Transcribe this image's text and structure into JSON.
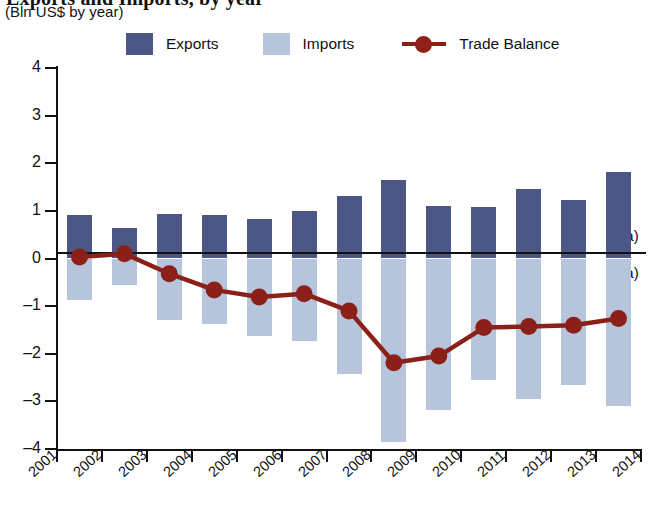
{
  "header": {
    "title_clipped": "Exports and Imports, by year",
    "subtitle": "(Bln US$ by year)"
  },
  "legend": {
    "items": [
      {
        "label": "Exports",
        "type": "swatch",
        "color": "#4d5786",
        "icon": "square-swatch-icon"
      },
      {
        "label": "Imports",
        "type": "swatch",
        "color": "#b6c5dc",
        "icon": "square-swatch-icon"
      },
      {
        "label": "Trade Balance",
        "type": "line-marker",
        "color": "#8b2018",
        "icon": "line-marker-icon"
      }
    ]
  },
  "annotations": {
    "na_above": "(na)",
    "na_below": "(na)"
  },
  "chart_data": {
    "type": "bar",
    "title": "Exports and Imports, by year",
    "subtitle": "(Bln US$ by year)",
    "xlabel": "",
    "ylabel": "",
    "ylim": [
      -4,
      4
    ],
    "ytick_labels": [
      "4",
      "3",
      "2",
      "1",
      "0",
      "–1",
      "–2",
      "–3",
      "–4"
    ],
    "ytick_values": [
      4,
      3,
      2,
      1,
      0,
      -1,
      -2,
      -3,
      -4
    ],
    "grid": false,
    "legend_position": "top",
    "xtick_labels": [
      "2001",
      "2002",
      "2003",
      "2004",
      "2005",
      "2006",
      "2007",
      "2008",
      "2009",
      "2010",
      "2011",
      "2012",
      "2013",
      "2014"
    ],
    "categories": [
      "2001",
      "2002",
      "2003",
      "2004",
      "2005",
      "2006",
      "2007",
      "2008",
      "2009",
      "2010",
      "2011",
      "2012",
      "2013"
    ],
    "series": [
      {
        "name": "Exports",
        "type": "bar",
        "color": "#4d5786",
        "values": [
          0.92,
          0.63,
          0.93,
          0.92,
          0.83,
          0.99,
          1.32,
          1.65,
          1.1,
          1.09,
          1.46,
          1.22,
          1.82
        ]
      },
      {
        "name": "Imports",
        "type": "bar",
        "color": "#b6c5dc",
        "values": [
          -0.88,
          -0.55,
          -1.3,
          -1.38,
          -1.63,
          -1.73,
          -2.42,
          -3.85,
          -3.18,
          -2.55,
          -2.95,
          -2.65,
          -3.1
        ]
      },
      {
        "name": "Trade Balance",
        "type": "line",
        "color": "#8b2018",
        "values": [
          0.03,
          0.1,
          -0.32,
          -0.66,
          -0.81,
          -0.74,
          -1.1,
          -2.19,
          -2.05,
          -1.45,
          -1.43,
          -1.4,
          -1.26
        ]
      }
    ],
    "annotations": [
      {
        "text": "(na)",
        "position": "right-above-zero"
      },
      {
        "text": "(na)",
        "position": "right-below-zero"
      }
    ]
  }
}
